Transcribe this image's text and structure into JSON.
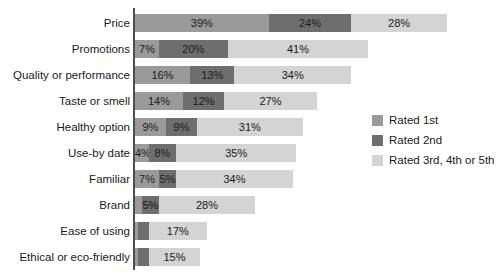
{
  "chart_data": {
    "type": "bar",
    "orientation": "horizontal",
    "stacked": true,
    "title": "",
    "subtitle": "",
    "xlabel": "",
    "ylabel": "",
    "xlim": [
      0,
      100
    ],
    "grid": false,
    "legend_position": "right",
    "categories": [
      "Price",
      "Promotions",
      "Quality or performance",
      "Taste or smell",
      "Healthy option",
      "Use-by date",
      "Familiar",
      "Brand",
      "Ease of using",
      "Ethical or eco-friendly"
    ],
    "series": [
      {
        "name": "Rated 1st",
        "color": "#9a9a9a",
        "values": [
          39,
          7,
          16,
          14,
          9,
          4,
          7,
          2,
          1,
          1
        ],
        "labels": [
          "39%",
          "7%",
          "16%",
          "14%",
          "9%",
          "4%",
          "7%",
          "",
          "",
          ""
        ]
      },
      {
        "name": "Rated 2nd",
        "color": "#6e6e6e",
        "values": [
          24,
          20,
          13,
          12,
          9,
          8,
          5,
          5,
          3,
          3
        ],
        "labels": [
          "24%",
          "20%",
          "13%",
          "12%",
          "9%",
          "8%",
          "5%",
          "5%",
          "",
          ""
        ]
      },
      {
        "name": "Rated 3rd, 4th or 5th",
        "color": "#d4d4d4",
        "values": [
          28,
          41,
          34,
          27,
          31,
          35,
          34,
          28,
          17,
          15
        ],
        "labels": [
          "28%",
          "41%",
          "34%",
          "27%",
          "31%",
          "35%",
          "34%",
          "28%",
          "17%",
          "15%"
        ]
      }
    ],
    "totals": [
      91,
      68,
      63,
      53,
      49,
      47,
      46,
      35,
      21,
      19
    ]
  },
  "legend": {
    "items": [
      {
        "label": "Rated 1st",
        "color": "#9a9a9a"
      },
      {
        "label": "Rated 2nd",
        "color": "#6e6e6e"
      },
      {
        "label": "Rated 3rd, 4th or 5th",
        "color": "#d4d4d4"
      }
    ]
  },
  "axis": {
    "line_color": "#4d4d4d"
  }
}
